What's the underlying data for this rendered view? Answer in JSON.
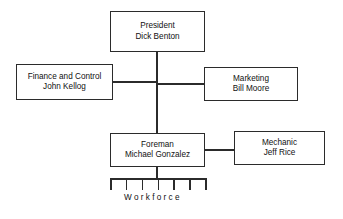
{
  "chart": {
    "type": "org-chart",
    "background_color": "#ffffff",
    "line_color": "#2b2b2b",
    "text_color": "#111111",
    "nodes": [
      {
        "id": "president",
        "title": "President",
        "name": "Dick Benton",
        "x": 110,
        "y": 11,
        "w": 95,
        "h": 41
      },
      {
        "id": "finance",
        "title": "Finance and Control",
        "name": "John Kellog",
        "x": 16,
        "y": 64,
        "w": 97,
        "h": 36
      },
      {
        "id": "marketing",
        "title": "Marketing",
        "name": "Bill Moore",
        "x": 204,
        "y": 67,
        "w": 94,
        "h": 34
      },
      {
        "id": "foreman",
        "title": "Foreman",
        "name": "Michael Gonzalez",
        "x": 110,
        "y": 133,
        "w": 95,
        "h": 34
      },
      {
        "id": "mechanic",
        "title": "Mechanic",
        "name": "Jeff Rice",
        "x": 234,
        "y": 131,
        "w": 91,
        "h": 34
      }
    ],
    "workforce": {
      "label": "Workforce",
      "teeth_count": 7,
      "bar_x": 110,
      "bar_y": 178,
      "bar_w": 95,
      "tooth_h": 12,
      "label_x": 124,
      "label_y": 193
    },
    "connectors": [
      {
        "id": "president-to-foreman-trunk",
        "orientation": "vertical",
        "x": 156,
        "y": 52,
        "length": 81
      },
      {
        "id": "finance-to-trunk",
        "orientation": "horizontal",
        "x": 113,
        "y": 81,
        "length": 44
      },
      {
        "id": "trunk-to-marketing",
        "orientation": "horizontal",
        "x": 156,
        "y": 83,
        "length": 48
      },
      {
        "id": "foreman-to-mechanic",
        "orientation": "horizontal",
        "x": 205,
        "y": 149,
        "length": 29
      },
      {
        "id": "foreman-to-workforce",
        "orientation": "vertical",
        "x": 156,
        "y": 167,
        "length": 12
      }
    ]
  }
}
